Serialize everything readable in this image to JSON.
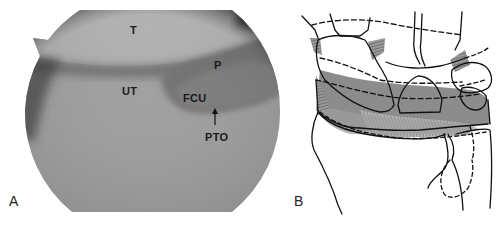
{
  "figure": {
    "panels": [
      {
        "letter": "A",
        "type": "arthroscopic-photograph",
        "labels": {
          "t": "T",
          "p": "P",
          "ut": "UT",
          "fcu": "FCU",
          "pto": "PTO"
        }
      },
      {
        "letter": "B",
        "type": "anatomic-line-drawing"
      }
    ]
  },
  "colors": {
    "background": "#ffffff",
    "scope_light": "#b9b9b9",
    "scope_mid": "#8c8c8c",
    "scope_dark": "#2a2a2a",
    "drawing_ink": "#111111",
    "drawing_shade": "#7a7a7a"
  }
}
